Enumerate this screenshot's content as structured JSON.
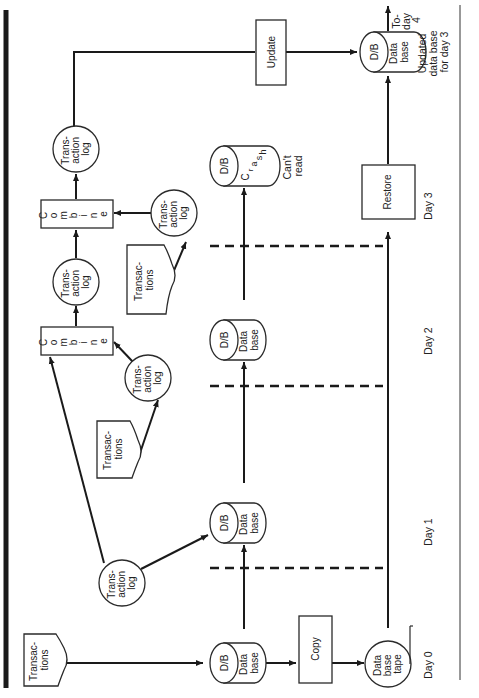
{
  "orientation": "rotated 90 degrees counter-clockwise (text reads bottom-to-top)",
  "days": {
    "day0": "Day 0",
    "day1": "Day 1",
    "day2": "Day 2",
    "day3": "Day 3",
    "today4": [
      "To-",
      "day",
      "4"
    ]
  },
  "nodes": {
    "transactions_day0": {
      "shape": "document",
      "lines": [
        "Transac-",
        "tions"
      ]
    },
    "db_day0": {
      "shape": "cylinder",
      "cap": "D/B",
      "lines": [
        "Data",
        "base"
      ]
    },
    "copy": {
      "shape": "process",
      "label": "Copy"
    },
    "tape": {
      "shape": "tape",
      "lines": [
        "Data",
        "base",
        "tape"
      ]
    },
    "txlog_day0": {
      "shape": "circle",
      "lines": [
        "Trans-",
        "action",
        "log"
      ]
    },
    "db_day1": {
      "shape": "cylinder",
      "cap": "D/B",
      "lines": [
        "Data",
        "base"
      ]
    },
    "transactions_day1": {
      "shape": "document",
      "lines": [
        "Transac-",
        "tions"
      ]
    },
    "txlog_day1": {
      "shape": "circle",
      "lines": [
        "Trans-",
        "action",
        "log"
      ]
    },
    "combine_1": {
      "shape": "process",
      "letters": [
        "C",
        "o",
        "m",
        "b",
        "i",
        "n",
        "e"
      ]
    },
    "db_day2": {
      "shape": "cylinder",
      "cap": "D/B",
      "lines": [
        "Data",
        "base"
      ]
    },
    "txlog_combined_1": {
      "shape": "circle",
      "lines": [
        "Trans-",
        "action",
        "log"
      ]
    },
    "transactions_day2": {
      "shape": "document",
      "lines": [
        "Transac-",
        "tions"
      ]
    },
    "txlog_day2": {
      "shape": "circle",
      "lines": [
        "Trans-",
        "action",
        "log"
      ]
    },
    "combine_2": {
      "shape": "process",
      "letters": [
        "C",
        "o",
        "m",
        "b",
        "i",
        "n",
        "e"
      ]
    },
    "txlog_combined_2": {
      "shape": "circle",
      "lines": [
        "Trans-",
        "action",
        "log"
      ]
    },
    "db_crash": {
      "shape": "cylinder",
      "cap": "D/B",
      "crash_letters": [
        "C",
        "r",
        "a",
        "s",
        "h"
      ],
      "note": [
        "Can't",
        "read"
      ]
    },
    "restore": {
      "shape": "process",
      "label": "Restore"
    },
    "update": {
      "shape": "process",
      "label": "Update"
    },
    "db_updated": {
      "shape": "cylinder",
      "cap": "D/B",
      "lines": [
        "Data",
        "base"
      ],
      "note": [
        "Updated",
        "data base",
        "for day 3"
      ]
    }
  },
  "edges": [
    [
      "transactions_day0",
      "db_day0"
    ],
    [
      "db_day0",
      "copy"
    ],
    [
      "copy",
      "tape"
    ],
    [
      "db_day0",
      "db_day1"
    ],
    [
      "txlog_day0",
      "db_day1"
    ],
    [
      "txlog_day0",
      "combine_1"
    ],
    [
      "db_day1",
      "db_day2"
    ],
    [
      "transactions_day1",
      "txlog_day1"
    ],
    [
      "txlog_day1",
      "combine_1"
    ],
    [
      "combine_1",
      "txlog_combined_1"
    ],
    [
      "db_day2",
      "db_crash"
    ],
    [
      "transactions_day2",
      "txlog_day2"
    ],
    [
      "txlog_day2",
      "combine_2"
    ],
    [
      "txlog_combined_1",
      "combine_2"
    ],
    [
      "combine_2",
      "txlog_combined_2"
    ],
    [
      "txlog_combined_2",
      "update"
    ],
    [
      "update",
      "db_updated"
    ],
    [
      "tape",
      "restore"
    ],
    [
      "restore",
      "db_updated"
    ],
    [
      "db_updated",
      "today4"
    ]
  ],
  "colors": {
    "ink": "#1a1a1a",
    "paper": "#ffffff"
  }
}
